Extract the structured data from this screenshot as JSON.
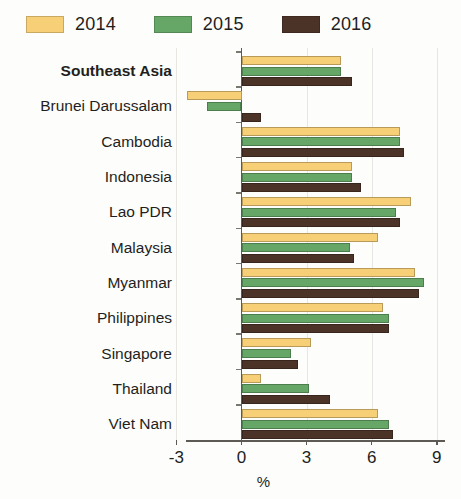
{
  "legend": {
    "items": [
      {
        "label": "2014",
        "color": "#f6cf77"
      },
      {
        "label": "2015",
        "color": "#66a767"
      },
      {
        "label": "2016",
        "color": "#4b3328"
      }
    ]
  },
  "axis": {
    "x_title": "%",
    "tick_labels": [
      "-3",
      "0",
      "3",
      "6",
      "9"
    ]
  },
  "chart_data": {
    "type": "bar",
    "orientation": "horizontal",
    "title": "",
    "xlabel": "%",
    "ylabel": "",
    "xlim": [
      -3,
      9
    ],
    "xticks": [
      -3,
      0,
      3,
      6,
      9
    ],
    "grid": true,
    "legend_position": "top-left",
    "categories": [
      "Southeast Asia",
      "Brunei Darussalam",
      "Cambodia",
      "Indonesia",
      "Lao PDR",
      "Malaysia",
      "Myanmar",
      "Philippines",
      "Singapore",
      "Thailand",
      "Viet Nam"
    ],
    "highlighted_categories": [
      "Southeast Asia"
    ],
    "series": [
      {
        "name": "2014",
        "color": "#f6cf77",
        "values": [
          4.6,
          -2.5,
          7.3,
          5.1,
          7.8,
          6.3,
          8.0,
          6.5,
          3.2,
          0.9,
          6.3
        ]
      },
      {
        "name": "2015",
        "color": "#66a767",
        "values": [
          4.6,
          -1.6,
          7.3,
          5.1,
          7.1,
          5.0,
          8.4,
          6.8,
          2.3,
          3.1,
          6.8
        ]
      },
      {
        "name": "2016",
        "color": "#4b3328",
        "values": [
          5.1,
          0.9,
          7.5,
          5.5,
          7.3,
          5.2,
          8.2,
          6.8,
          2.6,
          4.1,
          7.0
        ]
      }
    ]
  }
}
